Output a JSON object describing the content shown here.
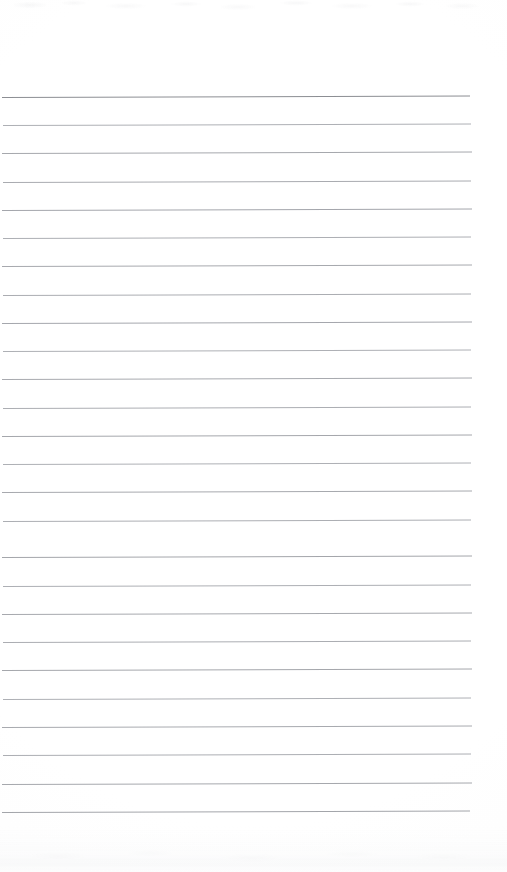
{
  "document": {
    "kind": "scanned-lined-paper",
    "title": "Blank ruled notebook page (scan)",
    "page_text": "",
    "handwriting_present": "none",
    "page_width_px": 507,
    "page_height_px": 872
  },
  "page": {
    "background_color": "#ffffff",
    "paper_tint_color": "#fdfdfd",
    "edge_shadow_color": "#f1f2f4",
    "top_margin_px": 97,
    "bottom_blank_px": 60
  },
  "ruling": {
    "header_rule": {
      "name": "header-rule",
      "y": 97,
      "x_start": 2,
      "x_end": 470,
      "thickness_px": 1.6,
      "color": "#8c8e93"
    },
    "line_color": "#a9abb0",
    "line_thickness_px": 1,
    "line_spacing_px": 28.3,
    "line_x_start": 2,
    "line_x_end": 472,
    "skew_deg": -0.17,
    "line_count": 26,
    "body_lines": [
      {
        "index": 1,
        "y": 125,
        "x_start": 3,
        "x_end": 471,
        "color": "#aeb0b5",
        "thickness_px": 1.0
      },
      {
        "index": 2,
        "y": 153,
        "x_start": 2,
        "x_end": 472,
        "color": "#a6a8ad",
        "thickness_px": 1.1
      },
      {
        "index": 3,
        "y": 182,
        "x_start": 3,
        "x_end": 471,
        "color": "#a9abb0",
        "thickness_px": 1.0
      },
      {
        "index": 4,
        "y": 210,
        "x_start": 2,
        "x_end": 472,
        "color": "#a4a6ac",
        "thickness_px": 1.1
      },
      {
        "index": 5,
        "y": 238,
        "x_start": 3,
        "x_end": 471,
        "color": "#adafb4",
        "thickness_px": 1.0
      },
      {
        "index": 6,
        "y": 266,
        "x_start": 2,
        "x_end": 472,
        "color": "#a7a9ae",
        "thickness_px": 1.0
      },
      {
        "index": 7,
        "y": 295,
        "x_start": 3,
        "x_end": 471,
        "color": "#abadb2",
        "thickness_px": 1.0
      },
      {
        "index": 8,
        "y": 323,
        "x_start": 2,
        "x_end": 472,
        "color": "#a5a7ad",
        "thickness_px": 1.1
      },
      {
        "index": 9,
        "y": 351,
        "x_start": 3,
        "x_end": 471,
        "color": "#aeb0b5",
        "thickness_px": 1.0
      },
      {
        "index": 10,
        "y": 379,
        "x_start": 2,
        "x_end": 472,
        "color": "#a8aaaf",
        "thickness_px": 1.0
      },
      {
        "index": 11,
        "y": 408,
        "x_start": 3,
        "x_end": 471,
        "color": "#acaeb3",
        "thickness_px": 1.0
      },
      {
        "index": 12,
        "y": 436,
        "x_start": 2,
        "x_end": 472,
        "color": "#a5a7ac",
        "thickness_px": 1.1
      },
      {
        "index": 13,
        "y": 464,
        "x_start": 3,
        "x_end": 471,
        "color": "#aeb0b5",
        "thickness_px": 1.0
      },
      {
        "index": 14,
        "y": 492,
        "x_start": 2,
        "x_end": 472,
        "color": "#a7a9ae",
        "thickness_px": 1.0
      },
      {
        "index": 15,
        "y": 521,
        "x_start": 3,
        "x_end": 471,
        "color": "#acaeb3",
        "thickness_px": 1.0
      },
      {
        "index": 16,
        "y": 557,
        "x_start": 2,
        "x_end": 472,
        "color": "#a4a6ab",
        "thickness_px": 1.1
      },
      {
        "index": 17,
        "y": 586,
        "x_start": 3,
        "x_end": 471,
        "color": "#adafb4",
        "thickness_px": 1.0
      },
      {
        "index": 18,
        "y": 614,
        "x_start": 2,
        "x_end": 472,
        "color": "#a7a9ae",
        "thickness_px": 1.0
      },
      {
        "index": 19,
        "y": 642,
        "x_start": 3,
        "x_end": 471,
        "color": "#abadb2",
        "thickness_px": 1.0
      },
      {
        "index": 20,
        "y": 670,
        "x_start": 2,
        "x_end": 472,
        "color": "#a5a7ac",
        "thickness_px": 1.1
      },
      {
        "index": 21,
        "y": 699,
        "x_start": 3,
        "x_end": 471,
        "color": "#aeb0b5",
        "thickness_px": 1.0
      },
      {
        "index": 22,
        "y": 727,
        "x_start": 2,
        "x_end": 472,
        "color": "#a8aaaf",
        "thickness_px": 1.0
      },
      {
        "index": 23,
        "y": 755,
        "x_start": 3,
        "x_end": 471,
        "color": "#acaeb3",
        "thickness_px": 1.0
      },
      {
        "index": 24,
        "y": 784,
        "x_start": 2,
        "x_end": 472,
        "color": "#a6a8ad",
        "thickness_px": 1.1
      },
      {
        "index": 25,
        "y": 812,
        "x_start": 2,
        "x_end": 470,
        "color": "#a3a5aa",
        "thickness_px": 1.1
      }
    ]
  }
}
